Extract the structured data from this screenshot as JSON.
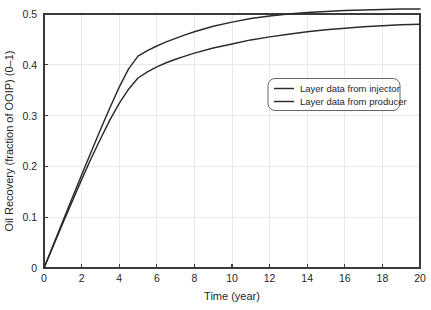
{
  "chart_data": {
    "type": "line",
    "title": "",
    "xlabel": "Time (year)",
    "ylabel": "Oil Recovery (fraction of OOIP) (0–1)",
    "xlim": [
      0,
      20
    ],
    "ylim": [
      0,
      0.5
    ],
    "xticks": [
      0,
      2,
      4,
      6,
      8,
      10,
      12,
      14,
      16,
      18,
      20
    ],
    "xtick_labels": [
      "0",
      "2",
      "4",
      "6",
      "8",
      "10",
      "12",
      "14",
      "16",
      "18",
      "20"
    ],
    "yticks": [
      0,
      0.1,
      0.2,
      0.3,
      0.4,
      0.5
    ],
    "ytick_labels": [
      "0",
      "0.1",
      "0.2",
      "0.3",
      "0.4",
      "0.5"
    ],
    "grid": true,
    "legend_position": "center-right-upper",
    "line_color": "#2b2b2b",
    "grid_color": "#e3e3e3",
    "axis_color": "#3a3a3a",
    "background": "#ffffff",
    "x": [
      0,
      0.5,
      1,
      1.5,
      2,
      2.5,
      3,
      3.5,
      4,
      4.5,
      5,
      5.5,
      6,
      6.5,
      7,
      7.5,
      8,
      9,
      10,
      11,
      12,
      13,
      14,
      15,
      16,
      17,
      18,
      19,
      20
    ],
    "series": [
      {
        "name": "Layer data from injector",
        "values": [
          0,
          0.046,
          0.092,
          0.138,
          0.183,
          0.228,
          0.272,
          0.315,
          0.356,
          0.392,
          0.417,
          0.428,
          0.437,
          0.445,
          0.452,
          0.459,
          0.465,
          0.476,
          0.484,
          0.491,
          0.496,
          0.5,
          0.503,
          0.505,
          0.507,
          0.508,
          0.509,
          0.51,
          0.51
        ]
      },
      {
        "name": "Layer data from producer",
        "values": [
          0,
          0.044,
          0.088,
          0.131,
          0.174,
          0.215,
          0.254,
          0.291,
          0.324,
          0.352,
          0.374,
          0.386,
          0.396,
          0.404,
          0.411,
          0.417,
          0.423,
          0.433,
          0.441,
          0.449,
          0.455,
          0.46,
          0.465,
          0.469,
          0.472,
          0.475,
          0.477,
          0.479,
          0.48
        ]
      }
    ]
  },
  "legend": {
    "entries": [
      {
        "label": "Layer data from injector"
      },
      {
        "label": "Layer data from producer"
      }
    ]
  }
}
